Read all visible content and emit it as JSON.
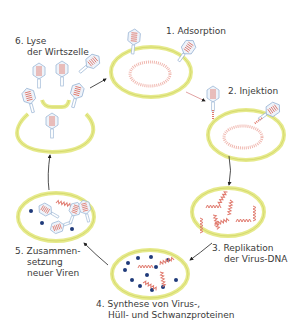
{
  "colors": {
    "membrane": "#e6ea8c",
    "membrane_stroke": "#c9cf5a",
    "dna": "#e8877a",
    "virus_head": "#aac4e0",
    "protein_dot": "#1f3a7a",
    "arrow": "#222222",
    "injection_arrow": "#d98a8a",
    "text": "#3a3a3a"
  },
  "steps": [
    {
      "number": "1.",
      "lines": [
        "Adsorption"
      ]
    },
    {
      "number": "2.",
      "lines": [
        "Injektion"
      ]
    },
    {
      "number": "3.",
      "lines": [
        "Replikation",
        "der Virus-DNA"
      ]
    },
    {
      "number": "4.",
      "lines": [
        "Synthese von Virus-,",
        "Hüll- und Schwanzproteinen"
      ]
    },
    {
      "number": "5.",
      "lines": [
        "Zusammen-",
        "setzung",
        "neuer Viren"
      ]
    },
    {
      "number": "6.",
      "lines": [
        "Lyse",
        "der Wirtszelle"
      ]
    }
  ]
}
